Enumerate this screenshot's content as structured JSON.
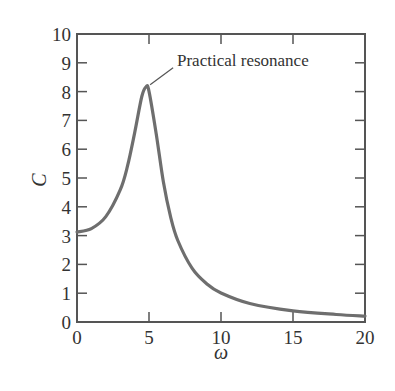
{
  "chart_data": {
    "type": "line",
    "title": "",
    "xlabel": "ω",
    "ylabel": "C",
    "xlim": [
      0,
      20
    ],
    "ylim": [
      0,
      10
    ],
    "xticks": [
      0,
      5,
      10,
      15,
      20
    ],
    "yticks": [
      0,
      1,
      2,
      3,
      4,
      5,
      6,
      7,
      8,
      9,
      10
    ],
    "grid": false,
    "legend": null,
    "colors": {
      "curve": "#6e6e6e",
      "axis": "#555555",
      "text": "#333333"
    },
    "series": [
      {
        "name": "C(ω)",
        "x": [
          0,
          1,
          2,
          3,
          3.5,
          4,
          4.5,
          4.8,
          5,
          5.5,
          6,
          6.5,
          7,
          8,
          9,
          10,
          12,
          15,
          18,
          20
        ],
        "y": [
          3.125,
          3.245,
          3.658,
          4.585,
          5.4,
          6.56,
          7.83,
          8.17,
          8.01,
          6.54,
          4.86,
          3.65,
          2.83,
          1.86,
          1.33,
          1.008,
          0.644,
          0.387,
          0.261,
          0.207
        ]
      }
    ],
    "annotations": [
      {
        "text": "Practical resonance",
        "x": 4.8,
        "y": 8.17,
        "text_x": 7.0,
        "text_y": 8.9
      }
    ]
  }
}
